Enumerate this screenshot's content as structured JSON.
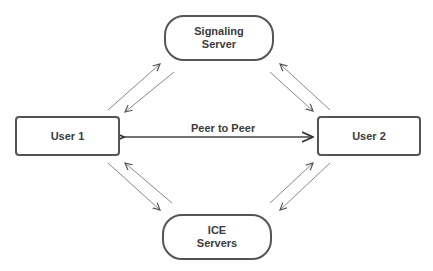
{
  "nodes": {
    "signaling": {
      "line1": "Signaling",
      "line2": "Server"
    },
    "user1": {
      "label": "User 1"
    },
    "user2": {
      "label": "User 2"
    },
    "ice": {
      "line1": "ICE",
      "line2": "Servers"
    }
  },
  "edges": {
    "peer_to_peer": {
      "label": "Peer to Peer"
    }
  },
  "colors": {
    "border": "#555555",
    "arrow": "#777777",
    "text": "#3c3c3c"
  }
}
